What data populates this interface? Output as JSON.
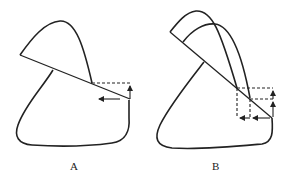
{
  "figures": [
    {
      "id": "A",
      "label": "A"
    },
    {
      "id": "B",
      "label": "B"
    }
  ],
  "colors": {
    "stroke": "#222222",
    "background": "#ffffff"
  }
}
